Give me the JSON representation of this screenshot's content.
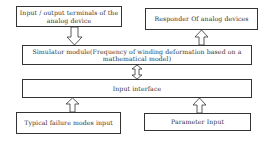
{
  "diagram": {
    "nodes": {
      "io_terminals": {
        "label": "Input / output terminals of the analog device"
      },
      "responder": {
        "label": "Responder Of analog devices"
      },
      "simulator": {
        "label": "Simulator module(Frequency of winding deformation based on a mathematical model)"
      },
      "input_interface": {
        "label": "Input interface"
      },
      "failure_modes": {
        "label": "Typical failure modes input"
      },
      "parameter_input": {
        "label": "Parameter Input"
      }
    },
    "edges": [
      {
        "from": "io_terminals",
        "to": "simulator",
        "type": "down-arrow"
      },
      {
        "from": "simulator",
        "to": "responder",
        "type": "up-arrow"
      },
      {
        "from": "simulator",
        "to": "input_interface",
        "type": "double-arrow"
      },
      {
        "from": "failure_modes",
        "to": "input_interface",
        "type": "up-arrow"
      },
      {
        "from": "parameter_input",
        "to": "input_interface",
        "type": "up-arrow"
      }
    ]
  }
}
